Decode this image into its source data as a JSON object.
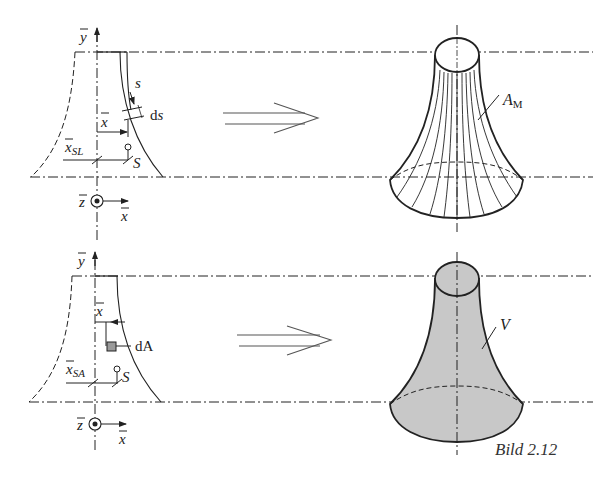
{
  "figure": {
    "caption": "Bild 2.12",
    "top": {
      "axis_y_label": "y",
      "axis_x_label": "x",
      "axis_z_label": "z",
      "arc_label": "s",
      "element_label": "ds",
      "distance_label": "x",
      "centroid_distance_label": "x",
      "centroid_distance_sub": "SL",
      "centroid_label": "S",
      "surface_label": "A",
      "surface_sub": "M"
    },
    "bottom": {
      "axis_y_label": "y",
      "axis_x_label": "x",
      "axis_z_label": "z",
      "distance_label": "x",
      "element_label": "dA",
      "centroid_distance_label": "x",
      "centroid_distance_sub": "SA",
      "centroid_label": "S",
      "volume_label": "V"
    },
    "colors": {
      "line": "#222222",
      "fill_volume": "#c8c8c8",
      "fill_element": "#9a9a9a"
    }
  }
}
